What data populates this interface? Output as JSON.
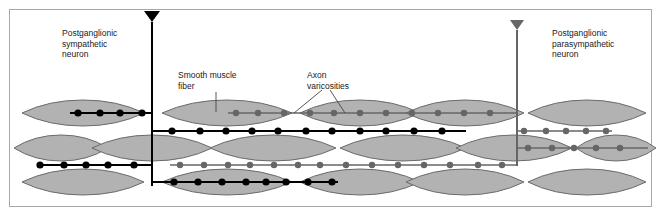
{
  "figure": {
    "background": "#ffffff",
    "border_color": "#a8a8a8",
    "width": 662,
    "height": 218
  },
  "colors": {
    "fiber_fill": "#b2b2b2",
    "fiber_stroke": "#6b6b6b",
    "sympathetic": "#000000",
    "parasympathetic": "#666666",
    "text": "#1a1a1a",
    "leader": "#444444"
  },
  "labels": {
    "sympathetic_neuron": "Postganglionic\nsympathetic\nneuron",
    "parasympathetic_neuron": "Postganglionic\nparasympathetic\nneuron",
    "smooth_muscle_fiber": "Smooth muscle\nfiber",
    "axon_varicosities": "Axon\nvaricosities"
  },
  "legend_keys": {
    "sympathetic_marker": "black-triangle-icon",
    "parasympathetic_marker": "gray-triangle-icon",
    "varicosity_marker": "varicosity-dot-icon",
    "fiber_marker": "smooth-muscle-fiber-icon"
  },
  "diagram": {
    "sympathetic_trunk": {
      "x": 152,
      "top": 22,
      "bottom": 186,
      "color": "#000000"
    },
    "parasympathetic_trunk": {
      "x": 517,
      "top": 30,
      "bottom": 166,
      "color": "#666666"
    },
    "rows": [
      {
        "name": "row-1-top",
        "y": 113
      },
      {
        "name": "row-2-upper",
        "y": 131
      },
      {
        "name": "row-3-middle",
        "y": 148
      },
      {
        "name": "row-4-lower",
        "y": 165
      },
      {
        "name": "row-5-bottom",
        "y": 182
      }
    ],
    "fibers": [
      {
        "row": 1,
        "x": 22,
        "w": 122,
        "h": 26
      },
      {
        "row": 1,
        "x": 162,
        "w": 130,
        "h": 26
      },
      {
        "row": 1,
        "x": 300,
        "w": 120,
        "h": 26
      },
      {
        "row": 1,
        "x": 406,
        "w": 118,
        "h": 26
      },
      {
        "row": 1,
        "x": 528,
        "w": 118,
        "h": 26
      },
      {
        "row": 3,
        "x": 14,
        "w": 94,
        "h": 26
      },
      {
        "row": 3,
        "x": 92,
        "w": 120,
        "h": 26
      },
      {
        "row": 3,
        "x": 210,
        "w": 126,
        "h": 26
      },
      {
        "row": 3,
        "x": 340,
        "w": 126,
        "h": 26
      },
      {
        "row": 3,
        "x": 456,
        "w": 116,
        "h": 26
      },
      {
        "row": 3,
        "x": 576,
        "w": 80,
        "h": 26
      },
      {
        "row": 5,
        "x": 22,
        "w": 122,
        "h": 26
      },
      {
        "row": 5,
        "x": 162,
        "w": 130,
        "h": 26
      },
      {
        "row": 5,
        "x": 300,
        "w": 120,
        "h": 26
      },
      {
        "row": 5,
        "x": 406,
        "w": 118,
        "h": 26
      },
      {
        "row": 5,
        "x": 528,
        "w": 118,
        "h": 26
      }
    ],
    "sympathetic_axons": [
      {
        "name": "sym-axon-row1-left",
        "y": 113,
        "x1": 70,
        "x2": 152,
        "varicosities": [
          78,
          100,
          120,
          142
        ]
      },
      {
        "name": "sym-axon-row2",
        "y": 131,
        "x1": 152,
        "x2": 466,
        "varicosities": [
          172,
          200,
          226,
          252,
          278,
          306,
          332,
          360,
          386,
          414,
          442
        ]
      },
      {
        "name": "sym-axon-row4",
        "y": 165,
        "x1": 38,
        "x2": 152,
        "varicosities": [
          40,
          64,
          86,
          108,
          134
        ]
      },
      {
        "name": "sym-axon-row5",
        "y": 182,
        "x1": 152,
        "x2": 338,
        "varicosities": [
          174,
          198,
          222,
          246,
          266,
          286,
          308,
          332
        ]
      }
    ],
    "parasympathetic_axons": [
      {
        "name": "para-axon-row1",
        "y": 113,
        "x1": 228,
        "x2": 517,
        "varicosities": [
          236,
          258,
          284,
          310,
          334,
          360,
          386,
          412,
          438,
          464,
          490
        ]
      },
      {
        "name": "para-axon-row2-right",
        "y": 131,
        "x1": 517,
        "x2": 612,
        "varicosities": [
          524,
          546,
          566,
          586,
          606
        ]
      },
      {
        "name": "para-axon-row3-right",
        "y": 148,
        "x1": 517,
        "x2": 648,
        "varicosities": [
          528,
          552,
          574,
          596,
          620
        ]
      },
      {
        "name": "para-axon-row4",
        "y": 165,
        "x1": 170,
        "x2": 517,
        "varicosities": [
          180,
          204,
          228,
          250,
          274,
          298,
          320,
          346,
          372,
          398,
          424,
          450,
          478,
          502
        ]
      }
    ],
    "leader_lines": [
      {
        "name": "leader-smooth-muscle-fiber",
        "x1": 216,
        "y1": 92,
        "x2": 216,
        "y2": 112
      },
      {
        "name": "leader-axon-varicosity-a",
        "x1": 322,
        "y1": 90,
        "x2": 294,
        "y2": 113
      },
      {
        "name": "leader-axon-varicosity-b",
        "x1": 330,
        "y1": 90,
        "x2": 345,
        "y2": 113
      }
    ]
  }
}
